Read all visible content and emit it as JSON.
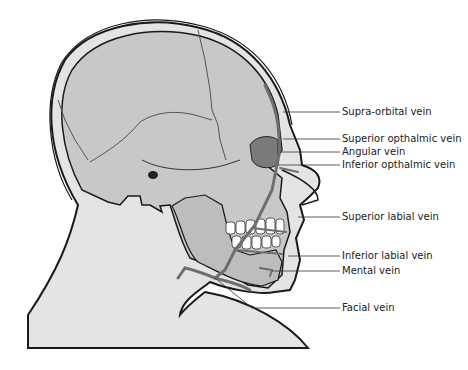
{
  "diagram": {
    "colors": {
      "skull": "#c8c8c8",
      "skin": "#e4e4e4",
      "vein": "#6e6e6e",
      "outline": "#1a1a1a",
      "leader": "#333333"
    },
    "labels": [
      {
        "text": "Supra-orbital vein",
        "y": 112,
        "target_x": 283,
        "target_y": 112
      },
      {
        "text": "Superior opthalmic vein",
        "y": 139,
        "target_x": 283,
        "target_y": 139
      },
      {
        "text": "Angular vein",
        "y": 152,
        "target_x": 280,
        "target_y": 152
      },
      {
        "text": "Inferior opthalmic vein",
        "y": 165,
        "target_x": 278,
        "target_y": 165
      },
      {
        "text": "Superior labial vein",
        "y": 217,
        "target_x": 298,
        "target_y": 217
      },
      {
        "text": "Inferior labial vein",
        "y": 256,
        "target_x": 288,
        "target_y": 256
      },
      {
        "text": "Mental vein",
        "y": 271,
        "target_x": 272,
        "target_y": 271
      },
      {
        "text": "Facial vein",
        "y": 308,
        "target_x": 252,
        "target_y": 308
      }
    ]
  }
}
